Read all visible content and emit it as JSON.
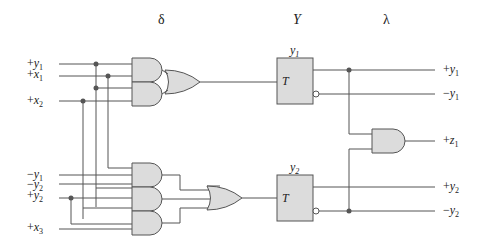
{
  "headers": {
    "delta": "δ",
    "Y": "Y",
    "lambda": "λ"
  },
  "inputs": {
    "top": [
      {
        "sign": "+",
        "var": "y",
        "sub": "1"
      },
      {
        "sign": "+",
        "var": "x",
        "sub": "1"
      },
      {
        "sign": "+",
        "var": "x",
        "sub": "2"
      }
    ],
    "bottom": [
      {
        "sign": "−",
        "var": "y",
        "sub": "1"
      },
      {
        "sign": "−",
        "var": "y",
        "sub": "2"
      },
      {
        "sign": "+",
        "var": "y",
        "sub": "2"
      },
      {
        "sign": "+",
        "var": "x",
        "sub": "3"
      }
    ]
  },
  "flipflops": [
    {
      "name_var": "y",
      "name_sub": "1",
      "input": "T"
    },
    {
      "name_var": "y",
      "name_sub": "2",
      "input": "T"
    }
  ],
  "outputs": [
    {
      "sign": "+",
      "var": "y",
      "sub": "1"
    },
    {
      "sign": "−",
      "var": "y",
      "sub": "1"
    },
    {
      "sign": "+",
      "var": "z",
      "sub": "1"
    },
    {
      "sign": "+",
      "var": "y",
      "sub": "2"
    },
    {
      "sign": "−",
      "var": "y",
      "sub": "2"
    }
  ],
  "colors": {
    "wire": "#555555",
    "gate_fill": "#dcdcdc",
    "accent_green": "#3cb043",
    "accent_purple": "#6a4fb0",
    "accent_magenta": "#c0307a",
    "accent_red": "#c04040"
  }
}
